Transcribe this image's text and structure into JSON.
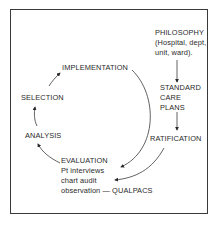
{
  "diagram": {
    "nodes": {
      "philosophy": {
        "title": "PHILOSOPHY",
        "lines": [
          "(Hospital, dept,",
          "unit, ward)."
        ]
      },
      "standard_care_plans": {
        "lines": [
          "STANDARD",
          "CARE",
          "PLANS"
        ]
      },
      "ratification": {
        "title": "RATIFICATION"
      },
      "evaluation": {
        "title": "EVALUATION",
        "lines": [
          "Pt interviews",
          "chart audit",
          "observation — QUALPACS"
        ]
      },
      "analysis": {
        "title": "ANALYSIS"
      },
      "selection": {
        "title": "SELECTION"
      },
      "implementation": {
        "title": "IMPLEMENTATION"
      }
    },
    "edges": [
      {
        "from": "PHILOSOPHY",
        "to": "STANDARD CARE PLANS"
      },
      {
        "from": "STANDARD CARE PLANS",
        "to": "RATIFICATION"
      },
      {
        "from": "RATIFICATION",
        "to": "EVALUATION"
      },
      {
        "from": "EVALUATION",
        "to": "ANALYSIS"
      },
      {
        "from": "ANALYSIS",
        "to": "SELECTION"
      },
      {
        "from": "SELECTION",
        "to": "IMPLEMENTATION"
      },
      {
        "from": "IMPLEMENTATION",
        "to": "EVALUATION"
      }
    ],
    "colors": {
      "line": "#3a3a3a",
      "text": "#2a2a2a",
      "background": "#ffffff"
    }
  }
}
